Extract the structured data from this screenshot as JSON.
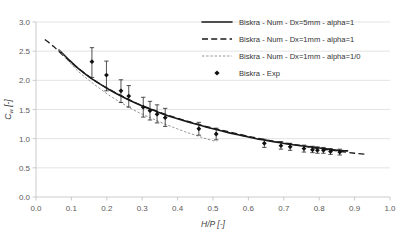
{
  "chart_data": {
    "type": "scatter",
    "title": "",
    "xlabel": "H/P [-]",
    "ylabel": "C_w [-]",
    "ylabel_main": "C",
    "ylabel_sub": "w",
    "ylabel_unit": " [-]",
    "xlim": [
      0.0,
      1.0
    ],
    "ylim": [
      0.0,
      3.0
    ],
    "xticks": [
      "0.0",
      "0.1",
      "0.2",
      "0.3",
      "0.4",
      "0.5",
      "0.6",
      "0.7",
      "0.8",
      "0.9",
      "1.0"
    ],
    "xtick_values": [
      0.0,
      0.1,
      0.2,
      0.3,
      0.4,
      0.5,
      0.6,
      0.7,
      0.8,
      0.9,
      1.0
    ],
    "yticks": [
      "0.0",
      "0.5",
      "1.0",
      "1.5",
      "2.0",
      "2.5",
      "3.0"
    ],
    "ytick_values": [
      0.0,
      0.5,
      1.0,
      1.5,
      2.0,
      2.5,
      3.0
    ],
    "grid": "horizontal",
    "legend_position": "top-right",
    "series": [
      {
        "name": "Biskra - Num - Dx=5mm - alpha=1",
        "style": "solid",
        "color": "#1a1a1a",
        "x": [
          0.065,
          0.09,
          0.12,
          0.15,
          0.18,
          0.21,
          0.24,
          0.27,
          0.3,
          0.33,
          0.36,
          0.4,
          0.44,
          0.48,
          0.52,
          0.56,
          0.6,
          0.64,
          0.68,
          0.72,
          0.76,
          0.8,
          0.84,
          0.88
        ],
        "y": [
          2.52,
          2.37,
          2.2,
          2.06,
          1.94,
          1.83,
          1.73,
          1.64,
          1.56,
          1.49,
          1.42,
          1.34,
          1.27,
          1.2,
          1.14,
          1.08,
          1.03,
          0.98,
          0.94,
          0.9,
          0.87,
          0.84,
          0.81,
          0.79
        ]
      },
      {
        "name": "Biskra - Num - Dx=1mm - alpha=1",
        "style": "dashed",
        "color": "#1a1a1a",
        "x": [
          0.025,
          0.05,
          0.08,
          0.11,
          0.14,
          0.17,
          0.2,
          0.24,
          0.28,
          0.32,
          0.36,
          0.4,
          0.45,
          0.5,
          0.55,
          0.6,
          0.65,
          0.7,
          0.75,
          0.8,
          0.85,
          0.9,
          0.935
        ],
        "y": [
          2.7,
          2.58,
          2.41,
          2.25,
          2.11,
          1.98,
          1.87,
          1.74,
          1.62,
          1.52,
          1.43,
          1.35,
          1.26,
          1.18,
          1.11,
          1.04,
          0.98,
          0.93,
          0.88,
          0.83,
          0.79,
          0.75,
          0.73
        ]
      },
      {
        "name": "Biskra - Num - Dx=1mm - alpha=1/0",
        "style": "dotted",
        "color": "#8a8a8a",
        "x": [
          0.065,
          0.09,
          0.12,
          0.15,
          0.18,
          0.21,
          0.24,
          0.27,
          0.3,
          0.33,
          0.36,
          0.39,
          0.42,
          0.45,
          0.48,
          0.51
        ],
        "y": [
          2.52,
          2.34,
          2.15,
          2.0,
          1.86,
          1.73,
          1.62,
          1.51,
          1.42,
          1.34,
          1.26,
          1.19,
          1.12,
          1.06,
          1.0,
          0.95
        ]
      }
    ],
    "points_series": {
      "name": "Biskra - Exp",
      "marker": "diamond",
      "color": "#111111",
      "points": [
        {
          "x": 0.158,
          "y": 2.32,
          "err_low": 0.27,
          "err_high": 0.24
        },
        {
          "x": 0.199,
          "y": 2.09,
          "err_low": 0.27,
          "err_high": 0.24
        },
        {
          "x": 0.24,
          "y": 1.82,
          "err_low": 0.2,
          "err_high": 0.19
        },
        {
          "x": 0.262,
          "y": 1.73,
          "err_low": 0.19,
          "err_high": 0.18
        },
        {
          "x": 0.303,
          "y": 1.54,
          "err_low": 0.17,
          "err_high": 0.17
        },
        {
          "x": 0.322,
          "y": 1.48,
          "err_low": 0.16,
          "err_high": 0.16
        },
        {
          "x": 0.342,
          "y": 1.42,
          "err_low": 0.15,
          "err_high": 0.16
        },
        {
          "x": 0.365,
          "y": 1.36,
          "err_low": 0.15,
          "err_high": 0.16
        },
        {
          "x": 0.46,
          "y": 1.17,
          "err_low": 0.11,
          "err_high": 0.11
        },
        {
          "x": 0.509,
          "y": 1.08,
          "err_low": 0.1,
          "err_high": 0.1
        },
        {
          "x": 0.645,
          "y": 0.92,
          "err_low": 0.07,
          "err_high": 0.07
        },
        {
          "x": 0.692,
          "y": 0.88,
          "err_low": 0.06,
          "err_high": 0.07
        },
        {
          "x": 0.718,
          "y": 0.86,
          "err_low": 0.06,
          "err_high": 0.06
        },
        {
          "x": 0.757,
          "y": 0.83,
          "err_low": 0.06,
          "err_high": 0.06
        },
        {
          "x": 0.781,
          "y": 0.81,
          "err_low": 0.05,
          "err_high": 0.06
        },
        {
          "x": 0.795,
          "y": 0.8,
          "err_low": 0.05,
          "err_high": 0.06
        },
        {
          "x": 0.812,
          "y": 0.8,
          "err_low": 0.05,
          "err_high": 0.05
        },
        {
          "x": 0.832,
          "y": 0.78,
          "err_low": 0.05,
          "err_high": 0.05
        },
        {
          "x": 0.858,
          "y": 0.77,
          "err_low": 0.05,
          "err_high": 0.05
        }
      ]
    },
    "legend": [
      {
        "label": "Biskra - Num - Dx=5mm - alpha=1",
        "style": "solid",
        "color": "#1a1a1a"
      },
      {
        "label": "Biskra - Num - Dx=1mm - alpha=1",
        "style": "dashed",
        "color": "#1a1a1a"
      },
      {
        "label": "Biskra - Num - Dx=1mm - alpha=1/0",
        "style": "dotted",
        "color": "#8a8a8a"
      },
      {
        "label": "Biskra - Exp",
        "style": "marker",
        "color": "#111111"
      }
    ]
  }
}
